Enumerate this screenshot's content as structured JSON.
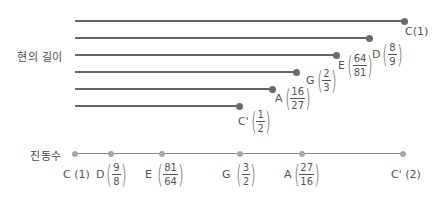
{
  "labels": {
    "string_length": "현의 길이",
    "frequency": "진동수"
  },
  "string_lengths": [
    {
      "note": "C",
      "text": "C(1)",
      "y": 21,
      "end_x": 404
    },
    {
      "note": "D",
      "num": "8",
      "den": "9",
      "y": 38,
      "end_x": 369
    },
    {
      "note": "E",
      "num": "64",
      "den": "81",
      "y": 55,
      "end_x": 336
    },
    {
      "note": "G",
      "num": "2",
      "den": "3",
      "y": 72,
      "end_x": 296
    },
    {
      "note": "A",
      "num": "16",
      "den": "27",
      "y": 89,
      "end_x": 272
    },
    {
      "note": "C'",
      "num": "1",
      "den": "2",
      "y": 106,
      "end_x": 239
    }
  ],
  "frequencies": [
    {
      "note": "C",
      "text": "(1)",
      "x": 75
    },
    {
      "note": "D",
      "num": "9",
      "den": "8",
      "x": 111
    },
    {
      "note": "E",
      "num": "81",
      "den": "64",
      "x": 162
    },
    {
      "note": "G",
      "num": "3",
      "den": "2",
      "x": 240
    },
    {
      "note": "A",
      "num": "27",
      "den": "16",
      "x": 302
    },
    {
      "note": "C'",
      "text": "(2)",
      "x": 403
    }
  ],
  "colors": {
    "line": "#666666",
    "dot_dark": "#6b6b6b",
    "dot_light": "#a8a8a8",
    "text": "#555555"
  }
}
